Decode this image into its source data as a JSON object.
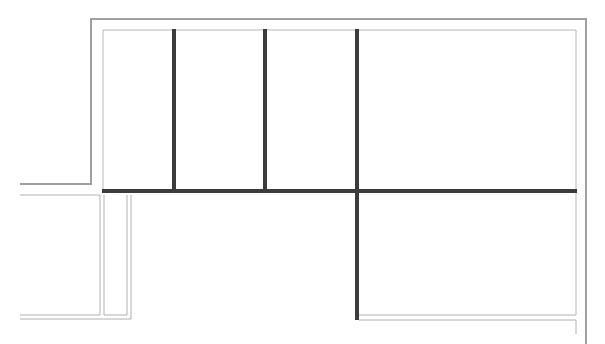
{
  "diagram": {
    "type": "floor-plan",
    "background": "#ffffff",
    "colors": {
      "wall": "#3c3c3c",
      "outer_line": "#a0a0a0",
      "inner_line": "#b8b8b8"
    },
    "outer_boundary": [
      [
        20,
        184
      ],
      [
        91,
        184
      ],
      [
        91,
        19
      ],
      [
        586,
        19
      ],
      [
        586,
        344
      ]
    ],
    "inner_boundary": [
      [
        103,
        191
      ],
      [
        103,
        30
      ],
      [
        576,
        30
      ],
      [
        576,
        191
      ]
    ],
    "rooms_top": [
      {
        "name": "room-1",
        "x1": 103,
        "x2": 174,
        "y1": 30,
        "y2": 191
      },
      {
        "name": "room-2",
        "x1": 174,
        "x2": 265,
        "y1": 30,
        "y2": 191
      },
      {
        "name": "room-3",
        "x1": 265,
        "x2": 357,
        "y1": 30,
        "y2": 191
      },
      {
        "name": "room-4",
        "x1": 357,
        "x2": 576,
        "y1": 30,
        "y2": 191
      }
    ],
    "walls": [
      {
        "name": "horizontal-main-wall",
        "x1": 103,
        "y1": 191,
        "x2": 576,
        "y2": 191
      },
      {
        "name": "partition-wall-1",
        "x1": 174,
        "y1": 30,
        "x2": 174,
        "y2": 191
      },
      {
        "name": "partition-wall-2",
        "x1": 265,
        "y1": 30,
        "x2": 265,
        "y2": 191
      },
      {
        "name": "partition-wall-3",
        "x1": 357,
        "y1": 30,
        "x2": 357,
        "y2": 319
      }
    ],
    "lower_left_block": {
      "x1": 20,
      "y1": 195,
      "x2": 100,
      "y2": 315
    },
    "corridor": {
      "x1": 104,
      "y1": 195,
      "x2": 128,
      "y2": 315
    },
    "lower_right_room": {
      "x1": 357,
      "y1": 191,
      "x2": 576,
      "y2": 315
    }
  }
}
